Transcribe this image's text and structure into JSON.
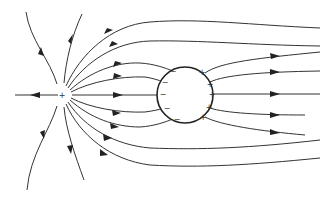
{
  "diagram": {
    "colors": {
      "line": "#333333",
      "sphere_outline": "#222222",
      "background": "#ffffff"
    },
    "point_charge": {
      "label": "+",
      "x": 62,
      "y": 95
    },
    "sphere": {
      "cx": 185,
      "cy": 95,
      "r": 28,
      "induced_negative": [
        {
          "label": "−",
          "x": 173,
          "y": 71
        },
        {
          "label": "−",
          "x": 164,
          "y": 82
        },
        {
          "label": "−",
          "x": 162,
          "y": 94
        },
        {
          "label": "−",
          "x": 167,
          "y": 108
        },
        {
          "label": "−",
          "x": 177,
          "y": 119
        }
      ],
      "induced_positive": [
        {
          "label": "+",
          "x": 202,
          "y": 72
        },
        {
          "label": "+",
          "x": 210,
          "y": 84
        },
        {
          "label": "+",
          "x": 212,
          "y": 94
        },
        {
          "label": "+",
          "x": 209,
          "y": 107
        },
        {
          "label": "+",
          "x": 203,
          "y": 117
        }
      ]
    }
  }
}
